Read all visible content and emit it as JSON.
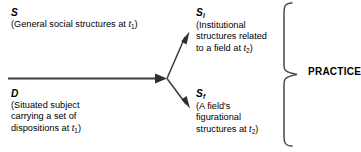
{
  "diagram": {
    "title_label": "PRACTICE",
    "nodes": [
      {
        "id": "S",
        "symbol": "S",
        "subscript": "",
        "lines": [
          "(General social structures at ",
          "t",
          "1",
          ")"
        ],
        "description": "(General social structures at t1)"
      },
      {
        "id": "D",
        "symbol": "D",
        "subscript": "",
        "line1": "(Situated subject",
        "line2": "carrying a set of",
        "line3_pre": "dispositions at  ",
        "line3_var": "t",
        "line3_sub": "1",
        "line3_post": ")"
      },
      {
        "id": "SI",
        "symbol": "S",
        "subscript": "I",
        "line1": "(Institutional",
        "line2": "structures related",
        "line3_pre": "to a field at ",
        "line3_var": "t",
        "line3_sub": "2",
        "line3_post": ")"
      },
      {
        "id": "Sf",
        "symbol": "S",
        "subscript": "f",
        "line1": "(A field's",
        "line2": "figurational",
        "line3_pre": "structures at ",
        "line3_var": "t",
        "line3_sub": "2",
        "line3_post": ")"
      }
    ],
    "node_s": {
      "symbol": "S",
      "subscript": "",
      "desc_pre": "(General social structures at ",
      "desc_var": "t",
      "desc_sub": "1",
      "desc_post": ")"
    },
    "node_d": {
      "symbol": "D",
      "subscript": "",
      "line1": "(Situated subject",
      "line2": "carrying a set of",
      "line3_pre": "dispositions at  ",
      "line3_var": "t",
      "line3_sub": "1",
      "line3_post": ")"
    },
    "node_si": {
      "symbol": "S",
      "subscript": "I",
      "line1": "(Institutional",
      "line2": "structures related",
      "line3_pre": "to a field at ",
      "line3_var": "t",
      "line3_sub": "2",
      "line3_post": ")"
    },
    "node_sf": {
      "symbol": "S",
      "subscript": "f",
      "line1": "(A field's",
      "line2": "figurational",
      "line3_pre": "structures at ",
      "line3_var": "t",
      "line3_sub": "2",
      "line3_post": ")"
    },
    "colors": {
      "stroke": "#3a3a3a",
      "text": "#000000",
      "background": "#ffffff"
    }
  }
}
